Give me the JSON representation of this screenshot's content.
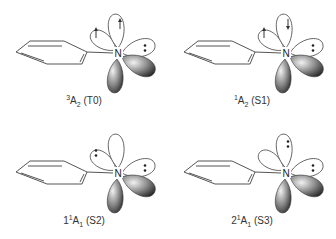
{
  "figure": {
    "colors": {
      "line": "#555555",
      "lobe_dark": "#3a3a3a",
      "lobe_light": "#e0e0e0",
      "text": "#333333"
    },
    "atom_label": "N",
    "panels": [
      {
        "id": "T0",
        "caption": {
          "prefix": "",
          "sup": "3",
          "term": "A",
          "sub": "2",
          "state": " (T0)"
        },
        "orbitals": {
          "upper_left": "up-arrow",
          "upper": "up-arrow",
          "right": "lone-pair"
        }
      },
      {
        "id": "S1",
        "caption": {
          "prefix": "",
          "sup": "1",
          "term": "A",
          "sub": "2",
          "state": " (S1)"
        },
        "orbitals": {
          "upper_left": "up-arrow",
          "upper": "down-arrow",
          "right": "lone-pair"
        }
      },
      {
        "id": "S2",
        "caption": {
          "prefix": "1",
          "sup": "1",
          "term": "A",
          "sub": "1",
          "state": " (S2)"
        },
        "orbitals": {
          "upper_left": "lone-pair",
          "upper": "empty",
          "right": "lone-pair"
        }
      },
      {
        "id": "S3",
        "caption": {
          "prefix": "2",
          "sup": "1",
          "term": "A",
          "sub": "1",
          "state": " (S3)"
        },
        "orbitals": {
          "upper_left": "empty",
          "upper": "lone-pair",
          "right": "lone-pair"
        }
      }
    ]
  }
}
